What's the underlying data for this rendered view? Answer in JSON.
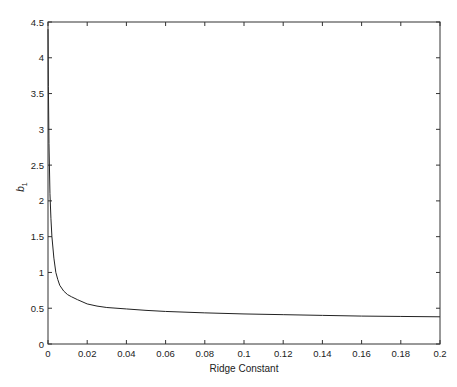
{
  "chart_data": {
    "type": "line",
    "title": "",
    "xlabel": "Ridge Constant",
    "ylabel": "b",
    "ylabel_subscript": "1",
    "xlim": [
      0,
      0.2
    ],
    "ylim": [
      0,
      4.5
    ],
    "grid": false,
    "legend": null,
    "x_ticks": [
      "0",
      "0.02",
      "0.04",
      "0.06",
      "0.08",
      "0.1",
      "0.12",
      "0.14",
      "0.16",
      "0.18",
      "0.2"
    ],
    "y_ticks": [
      "0",
      "0.5",
      "1",
      "1.5",
      "2",
      "2.5",
      "3",
      "3.5",
      "4",
      "4.5"
    ],
    "series": [
      {
        "name": "b1",
        "x": [
          0,
          0.0002,
          0.0005,
          0.001,
          0.0015,
          0.002,
          0.003,
          0.004,
          0.005,
          0.006,
          0.008,
          0.01,
          0.012,
          0.015,
          0.02,
          0.025,
          0.03,
          0.04,
          0.05,
          0.06,
          0.08,
          0.1,
          0.12,
          0.14,
          0.16,
          0.18,
          0.2
        ],
        "y": [
          4.4,
          3.6,
          2.8,
          2.1,
          1.75,
          1.5,
          1.2,
          1.0,
          0.9,
          0.82,
          0.74,
          0.69,
          0.66,
          0.62,
          0.56,
          0.53,
          0.51,
          0.49,
          0.47,
          0.455,
          0.435,
          0.42,
          0.41,
          0.4,
          0.39,
          0.385,
          0.38
        ]
      }
    ]
  }
}
